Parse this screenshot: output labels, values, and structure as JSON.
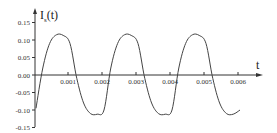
{
  "chart_data": {
    "type": "line",
    "title": "",
    "xlabel": "t",
    "ylabel": "I_s(t)",
    "ylabel_main": "I",
    "ylabel_sub": "s",
    "ylabel_tail": "(t)",
    "xlim": [
      0,
      0.0065
    ],
    "ylim": [
      -0.15,
      0.15
    ],
    "grid": false,
    "legend": null,
    "x_ticks": [
      "0.001",
      "0.002",
      "0.003",
      "0.004",
      "0.005",
      "0.006"
    ],
    "y_ticks": [
      "0.15",
      "0.10",
      "0.05",
      "0.00",
      "-0.05",
      "-0.10",
      "-0.15"
    ],
    "series": [
      {
        "name": "I_s(t)",
        "color": "#444444",
        "x": [
          0,
          0.0002,
          0.0004,
          0.0006,
          0.0008,
          0.001,
          0.0012,
          0.0014,
          0.0016,
          0.0018,
          0.002,
          0.0022,
          0.0024,
          0.0026,
          0.0028,
          0.003,
          0.0032,
          0.0034,
          0.0036,
          0.0038,
          0.004,
          0.0042,
          0.0044,
          0.0046,
          0.0048,
          0.005,
          0.0052,
          0.0054,
          0.0056,
          0.0058,
          0.006
        ],
        "y": [
          -0.095,
          0.02,
          0.09,
          0.115,
          0.113,
          0.09,
          -0.01,
          -0.08,
          -0.11,
          -0.112,
          -0.1,
          0.02,
          0.09,
          0.115,
          0.113,
          0.09,
          -0.01,
          -0.08,
          -0.11,
          -0.112,
          -0.1,
          0.02,
          0.09,
          0.115,
          0.113,
          0.09,
          -0.01,
          -0.08,
          -0.11,
          -0.112,
          -0.1
        ]
      }
    ]
  }
}
